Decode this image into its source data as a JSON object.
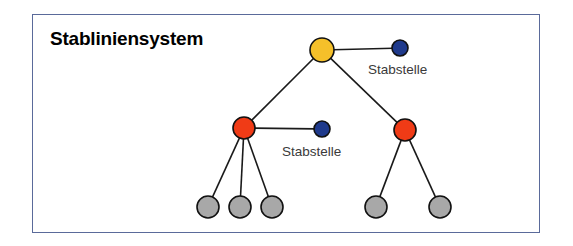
{
  "figure": {
    "title": "Stabliniensystem",
    "frame": {
      "x": 32,
      "y": 14,
      "width": 508,
      "height": 219,
      "border_color": "#5a6a9a",
      "background": "#ffffff"
    },
    "title_position": {
      "x": 50,
      "y": 28
    }
  },
  "colors": {
    "yellow": "#f5c02a",
    "red": "#f03b16",
    "blue": "#1f3a8c",
    "gray": "#a8a8a8",
    "outline": "#111111",
    "edge": "#1a1a1a",
    "label_text": "#3a3a3a",
    "title_text": "#000000",
    "frame_border": "#5a6a9a"
  },
  "chart_data": {
    "type": "diagram",
    "subtype": "organizational-chart-tree",
    "title": "Stabliniensystem",
    "nodes": [
      {
        "id": "root",
        "label": "",
        "role": "leitung",
        "color": "yellow",
        "x": 322,
        "y": 50,
        "r": 12,
        "level": 0
      },
      {
        "id": "staff-top",
        "label": "Stabstelle",
        "role": "stabstelle",
        "color": "blue",
        "x": 400,
        "y": 48,
        "r": 8,
        "level": 0
      },
      {
        "id": "line-left",
        "label": "",
        "role": "linie",
        "color": "red",
        "x": 244,
        "y": 128,
        "r": 11,
        "level": 1
      },
      {
        "id": "line-right",
        "label": "",
        "role": "linie",
        "color": "red",
        "x": 405,
        "y": 130,
        "r": 11,
        "level": 1
      },
      {
        "id": "staff-mid",
        "label": "Stabstelle",
        "role": "stabstelle",
        "color": "blue",
        "x": 322,
        "y": 129,
        "r": 8,
        "level": 1
      },
      {
        "id": "leaf-1",
        "label": "",
        "role": "stelle",
        "color": "gray",
        "x": 208,
        "y": 207,
        "r": 11,
        "level": 2
      },
      {
        "id": "leaf-2",
        "label": "",
        "role": "stelle",
        "color": "gray",
        "x": 240,
        "y": 207,
        "r": 11,
        "level": 2
      },
      {
        "id": "leaf-3",
        "label": "",
        "role": "stelle",
        "color": "gray",
        "x": 272,
        "y": 207,
        "r": 11,
        "level": 2
      },
      {
        "id": "leaf-4",
        "label": "",
        "role": "stelle",
        "color": "gray",
        "x": 376,
        "y": 207,
        "r": 11,
        "level": 2
      },
      {
        "id": "leaf-5",
        "label": "",
        "role": "stelle",
        "color": "gray",
        "x": 440,
        "y": 207,
        "r": 11,
        "level": 2
      }
    ],
    "edges": [
      {
        "from": "root",
        "to": "staff-top",
        "kind": "staff"
      },
      {
        "from": "root",
        "to": "line-left",
        "kind": "line"
      },
      {
        "from": "root",
        "to": "line-right",
        "kind": "line"
      },
      {
        "from": "line-left",
        "to": "staff-mid",
        "kind": "staff"
      },
      {
        "from": "line-left",
        "to": "leaf-1",
        "kind": "line"
      },
      {
        "from": "line-left",
        "to": "leaf-2",
        "kind": "line"
      },
      {
        "from": "line-left",
        "to": "leaf-3",
        "kind": "line"
      },
      {
        "from": "line-right",
        "to": "leaf-4",
        "kind": "line"
      },
      {
        "from": "line-right",
        "to": "leaf-5",
        "kind": "line"
      }
    ],
    "annotations": [
      {
        "id": "label-staff-top",
        "text": "Stabstelle",
        "x": 368,
        "y": 62
      },
      {
        "id": "label-staff-mid",
        "text": "Stabstelle",
        "x": 282,
        "y": 144
      }
    ]
  },
  "labels": {
    "staff_top": "Stabstelle",
    "staff_mid": "Stabstelle"
  }
}
